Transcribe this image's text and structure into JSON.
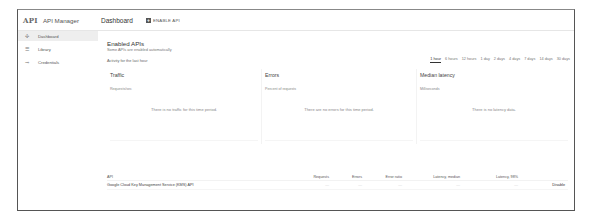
{
  "header": {
    "logo": "API",
    "app_name": "API Manager",
    "page_title": "Dashboard",
    "enable_api_label": "ENABLE API"
  },
  "sidebar": {
    "items": [
      {
        "icon": "dashboard-icon",
        "glyph": "✣",
        "label": "Dashboard",
        "active": true
      },
      {
        "icon": "library-icon",
        "glyph": "☰",
        "label": "Library",
        "active": false
      },
      {
        "icon": "credentials-key-icon",
        "glyph": "⊸",
        "label": "Credentials",
        "active": false
      }
    ]
  },
  "main": {
    "section_title": "Enabled APIs",
    "section_subtitle": "Some APIs are enabled automatically",
    "activity_label": "Activity for the last hour",
    "time_ranges": [
      {
        "label": "1 hour",
        "active": true
      },
      {
        "label": "6 hours",
        "active": false
      },
      {
        "label": "12 hours",
        "active": false
      },
      {
        "label": "1 day",
        "active": false
      },
      {
        "label": "2 days",
        "active": false
      },
      {
        "label": "4 days",
        "active": false
      },
      {
        "label": "7 days",
        "active": false
      },
      {
        "label": "14 days",
        "active": false
      },
      {
        "label": "30 days",
        "active": false
      }
    ],
    "panels": [
      {
        "title": "Traffic",
        "unit": "Requests/sec",
        "empty": "There is no traffic for this time period."
      },
      {
        "title": "Errors",
        "unit": "Percent of requests",
        "empty": "There are no errors for this time period."
      },
      {
        "title": "Median latency",
        "unit": "Milliseconds",
        "empty": "There is no latency data."
      }
    ],
    "table": {
      "columns": [
        "API",
        "Requests",
        "Errors",
        "Error ratio",
        "Latency, median",
        "Latency, 98%"
      ],
      "rows": [
        {
          "api": "Google Cloud Key Management Service (KMS) API",
          "requests": "—",
          "errors": "—",
          "error_ratio": "—",
          "latency_median": "—",
          "latency_98": "—",
          "action": "Disable"
        }
      ]
    }
  }
}
